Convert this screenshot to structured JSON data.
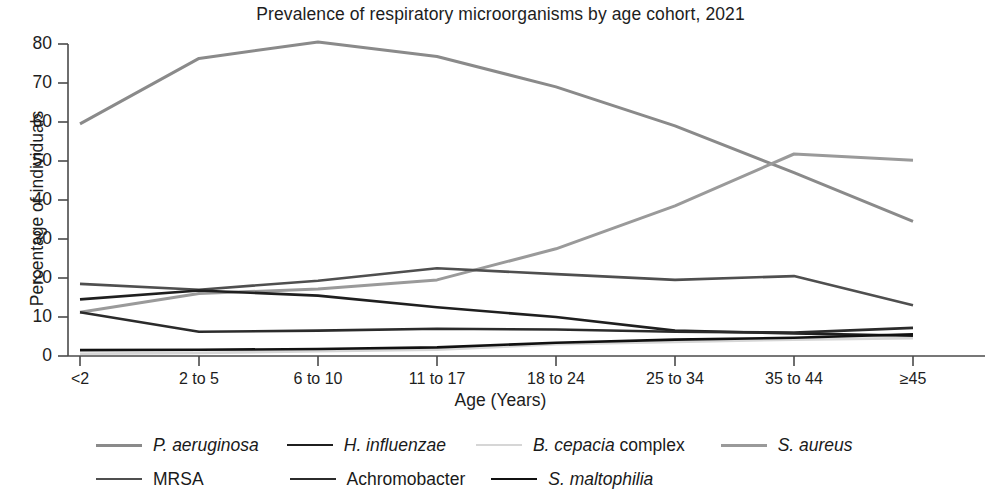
{
  "chart_data": {
    "type": "line",
    "title": "Prevalence of respiratory microorganisms by age cohort, 2021",
    "xlabel": "Age (Years)",
    "ylabel": "Percentage of individuals",
    "categories": [
      "<2",
      "2 to 5",
      "6 to 10",
      "11 to 17",
      "18 to 24",
      "25 to 34",
      "35 to 44",
      "≥45"
    ],
    "ylim": [
      0,
      80
    ],
    "yticks": [
      0,
      10,
      20,
      30,
      40,
      50,
      60,
      70,
      80
    ],
    "grid": false,
    "legend_position": "bottom",
    "series": [
      {
        "name": "P. aeruginosa",
        "name_italic": "P. aeruginosa",
        "name_roman": "",
        "color": "#8a8a8a",
        "width": 3.0,
        "values": [
          59.5,
          76.3,
          80.5,
          76.8,
          69.0,
          59.0,
          47.0,
          34.5
        ]
      },
      {
        "name": "H. influenzae",
        "name_italic": "H. influenzae",
        "name_roman": "",
        "color": "#1f1f1f",
        "width": 2.6,
        "values": [
          14.5,
          16.8,
          15.5,
          12.5,
          10.0,
          6.5,
          5.8,
          5.2
        ]
      },
      {
        "name": "B. cepacia complex",
        "name_italic": "B. cepacia",
        "name_roman": " complex",
        "color": "#d6d6d6",
        "width": 2.6,
        "values": [
          0.6,
          0.8,
          1.2,
          1.6,
          3.0,
          3.6,
          4.2,
          4.6
        ]
      },
      {
        "name": "S. aureus",
        "name_italic": "S. aureus",
        "name_roman": "",
        "color": "#9a9a9a",
        "width": 3.0,
        "values": [
          11.2,
          16.0,
          17.2,
          19.5,
          27.5,
          38.5,
          51.8,
          50.2
        ]
      },
      {
        "name": "MRSA",
        "name_italic": "",
        "name_roman": "MRSA",
        "color": "#4f4f4f",
        "width": 2.6,
        "values": [
          18.5,
          17.0,
          19.3,
          22.5,
          21.0,
          19.5,
          20.5,
          13.0
        ]
      },
      {
        "name": "Achromobacter",
        "name_italic": "",
        "name_roman": "Achromobacter",
        "color": "#2b2b2b",
        "width": 2.6,
        "values": [
          11.2,
          6.2,
          6.5,
          7.0,
          6.8,
          6.2,
          6.0,
          7.2
        ]
      },
      {
        "name": "S. maltophilia",
        "name_italic": "S. maltophilia",
        "name_roman": "",
        "color": "#111111",
        "width": 2.6,
        "values": [
          1.5,
          1.6,
          1.8,
          2.2,
          3.4,
          4.2,
          4.7,
          5.6
        ]
      }
    ]
  },
  "axis": {
    "tick_color": "#4a4a4a",
    "axis_color": "#4a4a4a"
  }
}
